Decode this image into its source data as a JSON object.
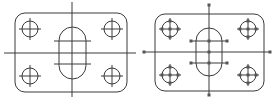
{
  "figure": {
    "panels": [
      {
        "name": "plain-drawing",
        "state": "unselected",
        "plate": {
          "x": 15,
          "y": 13,
          "w": 112,
          "h": 79,
          "r": 10
        },
        "centerlines": {
          "v": {
            "x": 72,
            "y1": 2,
            "y2": 97
          },
          "h": {
            "y": 53,
            "x1": 4,
            "x2": 136
          }
        },
        "holes": [
          {
            "cx": 30,
            "cy": 29,
            "r": 8
          },
          {
            "cx": 112,
            "cy": 29,
            "r": 8
          },
          {
            "cx": 30,
            "cy": 76,
            "r": 8
          },
          {
            "cx": 112,
            "cy": 76,
            "r": 8
          }
        ],
        "slot": {
          "x": 59,
          "y": 27,
          "w": 27,
          "h": 52,
          "r": 13.5
        },
        "slot_marks": [
          {
            "y": 41,
            "x1": 54,
            "x2": 91
          },
          {
            "y": 64,
            "x1": 54,
            "x2": 91
          }
        ]
      },
      {
        "name": "selected-drawing",
        "state": "selected-with-grips",
        "plate": {
          "x": 155,
          "y": 14,
          "w": 109,
          "h": 77,
          "r": 10
        },
        "centerlines": {
          "v": {
            "x": 209,
            "y1": 5,
            "y2": 95
          },
          "h": {
            "y": 52,
            "x1": 144,
            "x2": 270
          }
        },
        "holes": [
          {
            "cx": 170,
            "cy": 29,
            "r": 8
          },
          {
            "cx": 248,
            "cy": 29,
            "r": 8
          },
          {
            "cx": 170,
            "cy": 75,
            "r": 8
          },
          {
            "cx": 248,
            "cy": 75,
            "r": 8
          }
        ],
        "slot": {
          "x": 196,
          "y": 28,
          "w": 26,
          "h": 48,
          "r": 13
        },
        "slot_marks": [
          {
            "y": 41,
            "x1": 191,
            "x2": 227
          },
          {
            "y": 63,
            "x1": 191,
            "x2": 227
          }
        ]
      }
    ],
    "colors": {
      "line": "#3a3a3a",
      "grip": "#555555",
      "background": "#ffffff"
    }
  }
}
